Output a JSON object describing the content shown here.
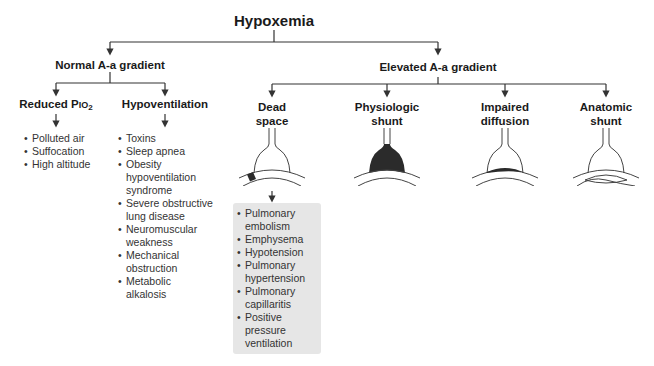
{
  "title": "Hypoxemia",
  "branches": {
    "normal": {
      "label": "Normal A-a gradient",
      "children": [
        {
          "label_main": "Reduced P",
          "label_sub_small": "IO",
          "label_subscript": "2",
          "items": [
            "Polluted air",
            "Suffocation",
            "High altitude"
          ]
        },
        {
          "label": "Hypoventilation",
          "items": [
            "Toxins",
            "Sleep apnea",
            "Obesity hypoventilation syndrome",
            "Severe obstructive lung disease",
            "Neuromuscular weakness",
            "Mechanical obstruction",
            "Metabolic alkalosis"
          ]
        }
      ]
    },
    "elevated": {
      "label": "Elevated A-a gradient",
      "children": [
        {
          "label_line1": "Dead",
          "label_line2": "space",
          "illustration": "alveolus-dead-space-icon",
          "items": [
            "Pulmonary embolism",
            "Emphysema",
            "Hypotension",
            "Pulmonary hypertension",
            "Pulmonary capillaritis",
            "Positive pressure ventilation"
          ]
        },
        {
          "label_line1": "Physiologic",
          "label_line2": "shunt",
          "illustration": "alveolus-filled-shunt-icon"
        },
        {
          "label_line1": "Impaired",
          "label_line2": "diffusion",
          "illustration": "alveolus-thickened-membrane-icon"
        },
        {
          "label_line1": "Anatomic",
          "label_line2": "shunt",
          "illustration": "alveolus-bypass-shunt-icon"
        }
      ]
    }
  },
  "colors": {
    "line": "#333333",
    "fill_dark": "#2b2b2b",
    "box_bg": "#e6e6e6",
    "text": "#1a1a1a"
  }
}
